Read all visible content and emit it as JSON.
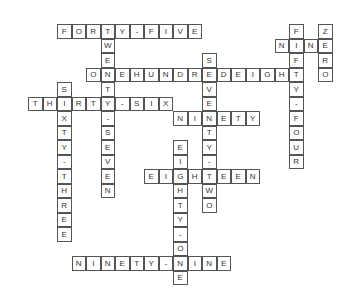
{
  "puzzle": {
    "type": "crossword",
    "origin": {
      "x": 28,
      "y": 24
    },
    "cell_size": 14.5,
    "words": [
      {
        "answer": "FORTY-FIVE",
        "dir": "across",
        "row": 0,
        "col": 2
      },
      {
        "answer": "NINE",
        "dir": "across",
        "row": 1,
        "col": 17
      },
      {
        "answer": "ONEHUNDREDEIGHT",
        "dir": "across",
        "row": 3,
        "col": 4
      },
      {
        "answer": "THIRTY-SIX",
        "dir": "across",
        "row": 5,
        "col": 0
      },
      {
        "answer": "NINETY",
        "dir": "across",
        "row": 6,
        "col": 10
      },
      {
        "answer": "EIGHTEEN",
        "dir": "across",
        "row": 10,
        "col": 8
      },
      {
        "answer": "NINETY-NINE",
        "dir": "across",
        "row": 16,
        "col": 3
      },
      {
        "answer": "TWENTY-SEVEN",
        "dir": "down",
        "row": 0,
        "col": 5
      },
      {
        "answer": "FIFTY-FOUR",
        "dir": "down",
        "row": 0,
        "col": 18
      },
      {
        "answer": "ZERO",
        "dir": "down",
        "row": 0,
        "col": 20
      },
      {
        "answer": "SEVENTY-TWO",
        "dir": "down",
        "row": 2,
        "col": 12
      },
      {
        "answer": "SIXTY-THREE",
        "dir": "down",
        "row": 4,
        "col": 2
      },
      {
        "answer": "EIGHTY-ONE",
        "dir": "down",
        "row": 8,
        "col": 10
      }
    ]
  }
}
